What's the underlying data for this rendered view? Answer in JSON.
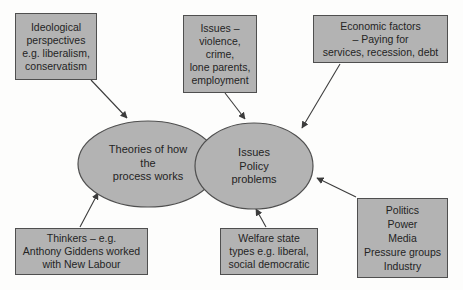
{
  "colors": {
    "shape_fill": "#b3b3b3",
    "shape_border": "#4f4f4f",
    "arrow": "#3c3c3c",
    "text": "#242424",
    "background": "#fdfdfc"
  },
  "boxes": [
    {
      "id": "ideological-perspectives",
      "label": "Ideological\nperspectives\ne.g. liberalism,\nconservatism"
    },
    {
      "id": "issues",
      "label": "Issues –\nviolence,\ncrime,\nlone parents,\nemployment"
    },
    {
      "id": "economic-factors",
      "label": "Economic factors\n– Paying for\nservices, recession, debt"
    },
    {
      "id": "thinkers",
      "label": "Thinkers – e.g.\nAnthony Giddens worked\nwith New Labour"
    },
    {
      "id": "welfare-state-types",
      "label": "Welfare state\ntypes e.g. liberal,\nsocial democratic"
    },
    {
      "id": "politics-power",
      "label": "Politics\nPower\nMedia\nPressure groups\nIndustry"
    }
  ],
  "ellipses": [
    {
      "id": "theories-of-how-process-works",
      "label": "Theories of how\nthe\nprocess works"
    },
    {
      "id": "issues-policy-problems",
      "label": "Issues\nPolicy\nproblems"
    }
  ],
  "connections": [
    {
      "from": "ideological-perspectives",
      "to": "theories-of-how-process-works"
    },
    {
      "from": "issues",
      "to": "issues-policy-problems"
    },
    {
      "from": "economic-factors",
      "to": "issues-policy-problems"
    },
    {
      "from": "thinkers",
      "to": "theories-of-how-process-works"
    },
    {
      "from": "welfare-state-types",
      "to": "issues-policy-problems"
    },
    {
      "from": "politics-power",
      "to": "issues-policy-problems"
    }
  ]
}
